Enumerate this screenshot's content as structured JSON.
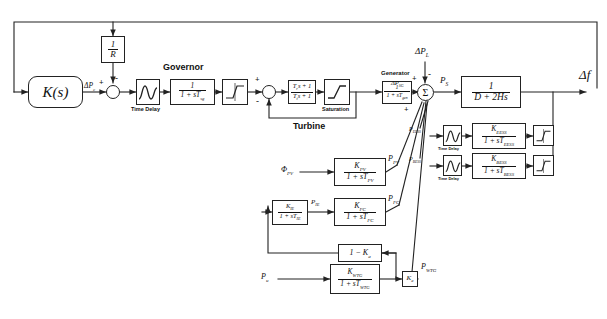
{
  "figure": {
    "type": "control-block-diagram"
  },
  "blocks": {
    "controller": {
      "label": "K(s)",
      "name": "controller-block"
    },
    "droop": {
      "num": "1",
      "den": "R",
      "name": "droop-gain-block"
    },
    "time_delay_gov": {
      "caption": "Time Delay",
      "name": "governor-time-delay-block"
    },
    "governor": {
      "caption": "Governor",
      "num": "1",
      "den": "1 + sT",
      "den_sub": "sg",
      "name": "governor-block"
    },
    "gov_limiter": {
      "name": "governor-limiter-block"
    },
    "turbine": {
      "caption": "Turbine",
      "num": "T",
      "num_sub": "r",
      "num_tail": "s + 1",
      "den": "T",
      "den_sub": "t",
      "den_tail": "s + 1",
      "name": "turbine-block"
    },
    "saturation": {
      "caption": "Saturation",
      "name": "saturation-block"
    },
    "generator": {
      "caption": "Generator",
      "num": "1",
      "den": "1 + sT",
      "den_sub": "gen",
      "name": "generator-block"
    },
    "power_system": {
      "num": "1",
      "den": "D + 2Hs",
      "name": "power-system-block"
    },
    "pv": {
      "num": "K",
      "num_sub": "PV",
      "den": "1 + sT",
      "den_sub": "PV",
      "name": "pv-block"
    },
    "ie": {
      "num": "K",
      "num_sub": "IE",
      "den": "1 + sT",
      "den_sub": "IE",
      "name": "electrolyzer-block"
    },
    "fc": {
      "num": "K",
      "num_sub": "FC",
      "den": "1 + sT",
      "den_sub": "FC",
      "name": "fuel-cell-block"
    },
    "one_minus_ka": {
      "label": "1 − K",
      "label_sub": "a",
      "name": "one-minus-ka-gain-block"
    },
    "wtg": {
      "num": "K",
      "num_sub": "WTG",
      "den": "1 + sT",
      "den_sub": "WTG",
      "name": "wtg-block"
    },
    "ka": {
      "label": "K",
      "label_sub": "a",
      "name": "ka-gain-block"
    },
    "eess_delay": {
      "caption": "Time Delay",
      "name": "eess-time-delay-block"
    },
    "eess": {
      "num": "K",
      "num_sub": "EESS",
      "den": "1 + sT",
      "den_sub": "EESS",
      "name": "eess-block"
    },
    "eess_limiter": {
      "name": "eess-limiter-block"
    },
    "bess_delay": {
      "caption": "Time Delay",
      "name": "bess-time-delay-block"
    },
    "bess": {
      "num": "K",
      "num_sub": "BESS",
      "den": "1 + sT",
      "den_sub": "BESS",
      "name": "bess-block"
    },
    "bess_limiter": {
      "name": "bess-limiter-block"
    }
  },
  "junctions": {
    "sum1": {
      "symbol": "",
      "name": "governor-summing-junction",
      "signs": [
        "+",
        "-"
      ]
    },
    "sum2": {
      "symbol": "",
      "name": "turbine-summing-junction",
      "signs": [
        "+",
        "-"
      ]
    },
    "sum3": {
      "symbol": "Σ",
      "name": "power-balance-summing-junction",
      "signs": [
        "+",
        "-",
        "+"
      ]
    }
  },
  "signals": {
    "delta_pc": {
      "text": "ΔP",
      "sub": "c",
      "name": "delta-pc-label"
    },
    "delta_pl": {
      "text": "ΔP",
      "sub": "L",
      "name": "delta-pl-label"
    },
    "delta_psg": {
      "text": "ΔP",
      "sub": "SG",
      "name": "delta-psg-label"
    },
    "ps": {
      "text": "P",
      "sub": "S",
      "name": "ps-label"
    },
    "delta_f": {
      "text": "Δf",
      "name": "delta-f-label"
    },
    "phi_pv": {
      "text": "Φ",
      "sub": "PV",
      "name": "phi-pv-label"
    },
    "p_pv": {
      "text": "P",
      "sub": "PV",
      "name": "p-pv-label"
    },
    "p_ie": {
      "text": "P",
      "sub": "IE",
      "name": "p-ie-label"
    },
    "p_fc": {
      "text": "P",
      "sub": "FC",
      "name": "p-fc-label"
    },
    "p_u": {
      "text": "P",
      "sub": "u",
      "name": "p-u-label"
    },
    "p_wtg": {
      "text": "P",
      "sub": "WTG",
      "name": "p-wtg-label"
    },
    "p_eess": {
      "text": "P",
      "sub": "EESS",
      "name": "p-eess-label"
    },
    "p_bess": {
      "text": "P",
      "sub": "BESS",
      "name": "p-bess-label"
    }
  },
  "signs": {
    "plus": "+",
    "minus": "-"
  },
  "colors": {
    "line": "#222222",
    "text": "#111111",
    "background": "#ffffff"
  }
}
